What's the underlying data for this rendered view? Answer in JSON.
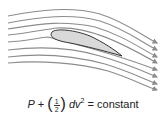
{
  "diagram": {
    "streamline_count": 8,
    "streamline_color": "#8c8c8c",
    "airfoil_fill": "#d9d9d9",
    "airfoil_stroke": "#333333"
  },
  "equation": {
    "p": "P",
    "plus": "+",
    "open_paren": "(",
    "num": "1",
    "den": "2",
    "close_paren": ")",
    "d": "d",
    "v": "v",
    "exp": "2",
    "equals": "=",
    "rhs": "constant"
  }
}
